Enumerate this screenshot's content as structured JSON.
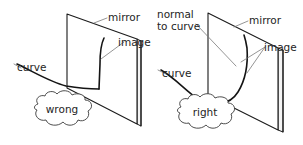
{
  "figure": {
    "background_color": "#ffffff",
    "ink_color": "#1b1b1b",
    "leader_color": "#7a7a7a"
  },
  "panels": [
    {
      "id": "wrong",
      "verdict_label": "wrong",
      "labels": {
        "mirror": "mirror",
        "image": "image",
        "curve": "curve"
      }
    },
    {
      "id": "right",
      "verdict_label": "right",
      "labels": {
        "normal_line1": "normal",
        "normal_line2": "to curve",
        "mirror": "mirror",
        "image": "image",
        "curve": "curve"
      }
    }
  ]
}
